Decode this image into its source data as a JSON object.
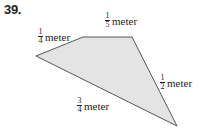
{
  "problem": {
    "number": "39."
  },
  "figure": {
    "shape": "quadrilateral",
    "fill_color": "#e4e4e4",
    "stroke_color": "#555555",
    "vertices": [
      [
        36,
        56
      ],
      [
        83,
        37
      ],
      [
        132,
        37
      ],
      [
        177,
        126
      ]
    ],
    "labels": {
      "left_side": {
        "num": "1",
        "den": "4",
        "unit": "meter"
      },
      "top_side": {
        "num": "1",
        "den": "5",
        "unit": "meter"
      },
      "right_side": {
        "num": "1",
        "den": "2",
        "unit": "meter"
      },
      "bottom_side": {
        "num": "3",
        "den": "4",
        "unit": "meter"
      }
    }
  }
}
